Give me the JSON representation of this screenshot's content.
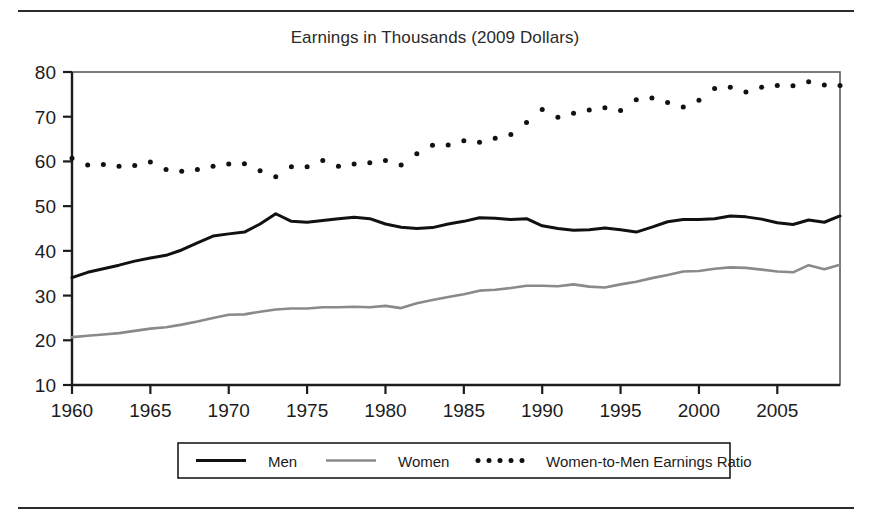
{
  "figure": {
    "title": "Earnings in Thousands (2009 Dollars)",
    "has_top_rule": true,
    "has_bottom_rule": true,
    "background": "#ffffff"
  },
  "chart_data": {
    "type": "line",
    "title": "Earnings in Thousands (2009 Dollars)",
    "xlabel": "",
    "ylabel": "",
    "xlim": [
      1960,
      2009
    ],
    "ylim": [
      10,
      80
    ],
    "grid": false,
    "legend_position": "bottom",
    "xticks": [
      1960,
      1965,
      1970,
      1975,
      1980,
      1985,
      1990,
      1995,
      2000,
      2005
    ],
    "yticks": [
      10,
      20,
      30,
      40,
      50,
      60,
      70,
      80
    ],
    "x": [
      1960,
      1961,
      1962,
      1963,
      1964,
      1965,
      1966,
      1967,
      1968,
      1969,
      1970,
      1971,
      1972,
      1973,
      1974,
      1975,
      1976,
      1977,
      1978,
      1979,
      1980,
      1981,
      1982,
      1983,
      1984,
      1985,
      1986,
      1987,
      1988,
      1989,
      1990,
      1991,
      1992,
      1993,
      1994,
      1995,
      1996,
      1997,
      1998,
      1999,
      2000,
      2001,
      2002,
      2003,
      2004,
      2005,
      2006,
      2007,
      2008,
      2009
    ],
    "series": [
      {
        "name": "Men",
        "style": "solid",
        "color": "#111111",
        "width": 3.0,
        "values": [
          34.0,
          35.2,
          36.0,
          36.8,
          37.7,
          38.4,
          39.0,
          40.2,
          41.8,
          43.3,
          43.8,
          44.2,
          46.0,
          48.3,
          46.6,
          46.4,
          46.8,
          47.2,
          47.5,
          47.2,
          46.0,
          45.3,
          45.0,
          45.2,
          46.0,
          46.6,
          47.4,
          47.3,
          47.0,
          47.2,
          45.6,
          45.0,
          44.6,
          44.7,
          45.1,
          44.7,
          44.2,
          45.3,
          46.5,
          47.0,
          47.0,
          47.2,
          47.8,
          47.6,
          47.1,
          46.3,
          45.9,
          46.9,
          46.4,
          47.8
        ]
      },
      {
        "name": "Women",
        "style": "solid",
        "color": "#8a8a8a",
        "width": 2.6,
        "values": [
          20.7,
          21.0,
          21.3,
          21.6,
          22.1,
          22.6,
          22.9,
          23.5,
          24.2,
          25.0,
          25.7,
          25.8,
          26.4,
          26.9,
          27.1,
          27.1,
          27.4,
          27.4,
          27.5,
          27.4,
          27.7,
          27.2,
          28.3,
          29.0,
          29.7,
          30.3,
          31.1,
          31.3,
          31.7,
          32.2,
          32.2,
          32.1,
          32.5,
          32.0,
          31.8,
          32.5,
          33.1,
          33.9,
          34.6,
          35.4,
          35.5,
          36.0,
          36.3,
          36.2,
          35.8,
          35.4,
          35.2,
          36.8,
          35.9,
          36.9
        ]
      },
      {
        "name": "Women-to-Men Earnings Ratio",
        "style": "dotted",
        "color": "#111111",
        "width": 3.2,
        "values": [
          60.7,
          59.2,
          59.3,
          58.9,
          59.1,
          59.9,
          58.2,
          57.8,
          58.2,
          58.9,
          59.4,
          59.5,
          57.9,
          56.6,
          58.8,
          58.8,
          60.2,
          58.9,
          59.4,
          59.7,
          60.2,
          59.2,
          61.7,
          63.6,
          63.7,
          64.6,
          64.3,
          65.2,
          66.0,
          68.7,
          71.6,
          69.9,
          70.8,
          71.5,
          72.0,
          71.4,
          73.8,
          74.2,
          73.2,
          72.2,
          73.7,
          76.3,
          76.6,
          75.5,
          76.6,
          77.0,
          76.9,
          77.8,
          77.1,
          77.0
        ]
      }
    ]
  },
  "axes": {
    "y_tick_labels": [
      "80",
      "70",
      "60",
      "50",
      "40",
      "30",
      "20",
      "10"
    ],
    "x_tick_labels": [
      "1960",
      "1965",
      "1970",
      "1975",
      "1980",
      "1985",
      "1990",
      "1995",
      "2000",
      "2005"
    ]
  },
  "legend": {
    "entries": [
      {
        "label": "Men",
        "marker": "solid-line",
        "color": "#111111"
      },
      {
        "label": "Women",
        "marker": "solid-line",
        "color": "#8a8a8a"
      },
      {
        "label": "Women-to-Men Earnings Ratio",
        "marker": "dotted-line",
        "color": "#111111"
      }
    ]
  }
}
